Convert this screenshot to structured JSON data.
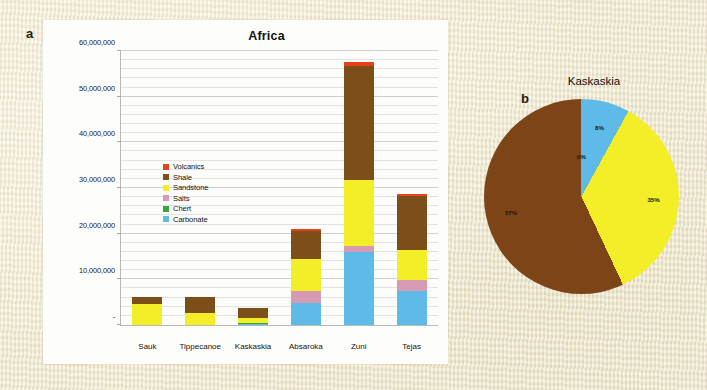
{
  "figure": {
    "panel_a_letter": "a",
    "panel_b_letter": "b"
  },
  "bar_panel": {
    "title": "Africa",
    "legend": [
      {
        "label": "Volcanics",
        "color": "#e8401a"
      },
      {
        "label": "Shale",
        "color": "#7d4f18"
      },
      {
        "label": "Sandstone",
        "color": "#f4ee28"
      },
      {
        "label": "Salts",
        "color": "#d69ab4"
      },
      {
        "label": "Chert",
        "color": "#34a83a"
      },
      {
        "label": "Carbonate",
        "color": "#5ebbe8"
      }
    ],
    "y_ticks": [
      "60,000,000",
      "50,000,000",
      "40,000,000",
      "30,000,000",
      "20,000,000",
      "10,000,000",
      "-"
    ]
  },
  "pie_panel": {
    "title": "Kaskaskia",
    "labels": [
      "0%",
      "8%",
      "35%",
      "57%"
    ]
  },
  "chart_data": [
    {
      "type": "bar",
      "subtype": "stacked-column",
      "title": "Africa",
      "xlabel": "",
      "ylabel": "",
      "ylim": [
        0,
        60000000
      ],
      "y_major_step": 10000000,
      "y_minor_step": 2000000,
      "grid": true,
      "legend_position": "inside-upper-left",
      "categories": [
        "Sauk",
        "Tippecanoe",
        "Kaskaskia",
        "Absaroka",
        "Zuni",
        "Tejas"
      ],
      "y_tick_labels": [
        "-",
        "10,000,000",
        "20,000,000",
        "30,000,000",
        "40,000,000",
        "50,000,000",
        "60,000,000"
      ],
      "series": [
        {
          "name": "Carbonate",
          "color": "#5ebbe8",
          "values": [
            0,
            0,
            200000,
            4800000,
            16000000,
            7500000
          ]
        },
        {
          "name": "Chert",
          "color": "#34a83a",
          "values": [
            0,
            0,
            150000,
            0,
            0,
            0
          ]
        },
        {
          "name": "Salts",
          "color": "#d69ab4",
          "values": [
            0,
            0,
            0,
            2600000,
            1300000,
            2400000
          ]
        },
        {
          "name": "Sandstone",
          "color": "#f4ee28",
          "values": [
            4500000,
            2700000,
            1150000,
            7100000,
            14500000,
            6600000
          ]
        },
        {
          "name": "Shale",
          "color": "#7d4f18",
          "values": [
            1600000,
            3400000,
            2300000,
            6100000,
            25000000,
            11700000
          ]
        },
        {
          "name": "Volcanics",
          "color": "#e8401a",
          "values": [
            0,
            0,
            0,
            400000,
            700000,
            600000
          ]
        }
      ],
      "totals": [
        6100000,
        6100000,
        3800000,
        21000000,
        57500000,
        28800000
      ]
    },
    {
      "type": "pie",
      "title": "Kaskaskia",
      "labels": [
        "Chert",
        "Carbonate",
        "Sandstone",
        "Shale"
      ],
      "values": [
        0,
        8,
        35,
        57
      ],
      "value_labels": [
        "0%",
        "8%",
        "35%",
        "57%"
      ],
      "colors": [
        "#34a83a",
        "#5ebbe8",
        "#f4ee28",
        "#7d4418"
      ],
      "units": "percent",
      "start_angle_deg": 0,
      "legend_position": "none"
    }
  ]
}
